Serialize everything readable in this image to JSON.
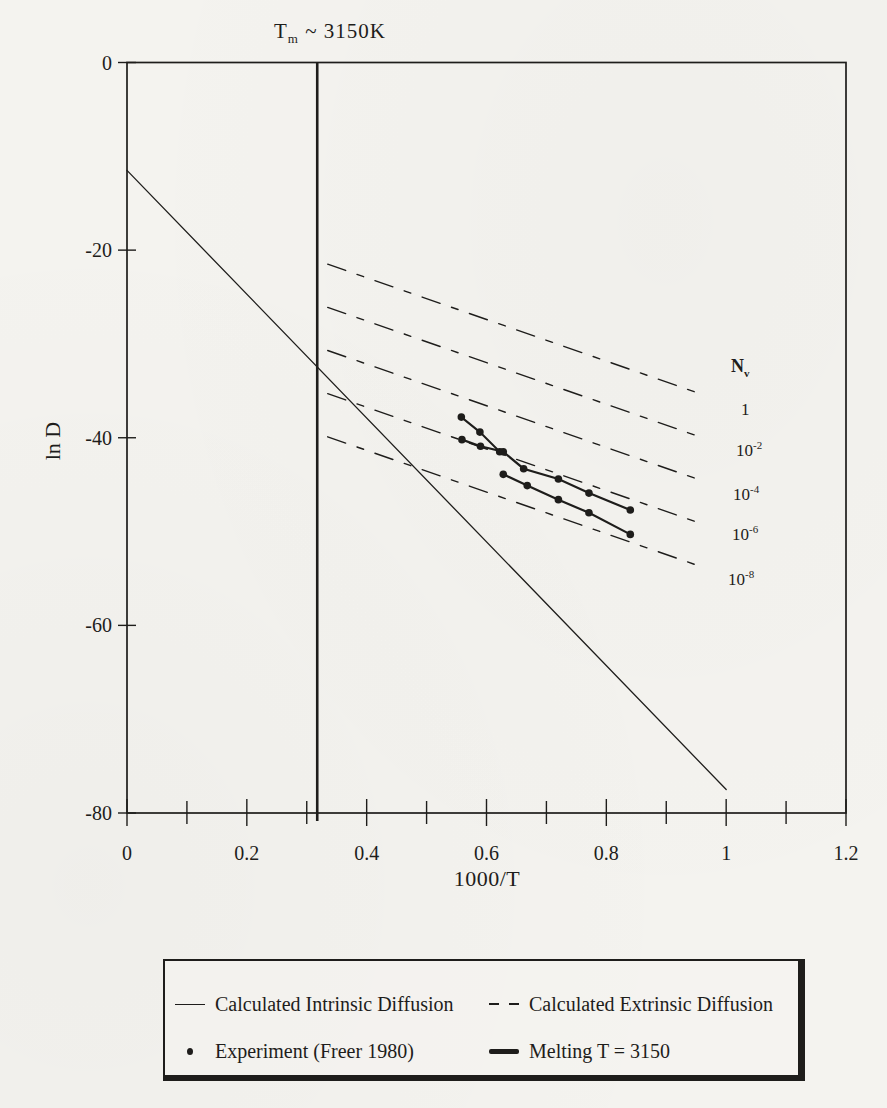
{
  "page": {
    "background": "#f4f3ef",
    "ink": "#1e1d1b"
  },
  "title": {
    "base": "T",
    "sub": "m",
    "rest": "~ 3150K"
  },
  "axes": {
    "x": {
      "label": "1000/T"
    },
    "y": {
      "label": "ln D"
    }
  },
  "nv": {
    "header": {
      "base": "N",
      "sub": "v"
    },
    "labels": [
      {
        "base": "1",
        "exp": ""
      },
      {
        "base": "10",
        "exp": "-2"
      },
      {
        "base": "10",
        "exp": "-4"
      },
      {
        "base": "10",
        "exp": "-6"
      },
      {
        "base": "10",
        "exp": "-8"
      }
    ]
  },
  "legend": {
    "entries": [
      {
        "swatch": "thin-solid-line",
        "label": "Calculated Intrinsic Diffusion"
      },
      {
        "swatch": "dashed-line",
        "label": "Calculated Extrinsic Diffusion"
      },
      {
        "swatch": "dot-marker",
        "label": "Experiment (Freer 1980)"
      },
      {
        "swatch": "thick-solid-line",
        "label": "Melting T = 3150"
      }
    ]
  },
  "chart_data": {
    "type": "line",
    "xlabel": "1000/T",
    "ylabel": "ln D",
    "xlim": [
      0,
      1.2
    ],
    "ylim": [
      -80,
      0
    ],
    "grid": false,
    "legend_position": "bottom",
    "x_minor_step": 0.1,
    "x_ticks": [
      {
        "v": 0,
        "t": "0"
      },
      {
        "v": 0.2,
        "t": "0.2"
      },
      {
        "v": 0.4,
        "t": "0.4"
      },
      {
        "v": 0.6,
        "t": "0.6"
      },
      {
        "v": 0.8,
        "t": "0.8"
      },
      {
        "v": 1,
        "t": "1"
      },
      {
        "v": 1.2,
        "t": "1.2"
      }
    ],
    "y_ticks": [
      {
        "v": 0,
        "t": "0"
      },
      {
        "v": -20,
        "t": "-20"
      },
      {
        "v": -40,
        "t": "-40"
      },
      {
        "v": -60,
        "t": "-60"
      },
      {
        "v": -80,
        "t": "-80"
      }
    ],
    "series": [
      {
        "id": "intrinsic-diffusion-line",
        "name": "Calculated Intrinsic Diffusion",
        "style": "solid",
        "width": 1.3,
        "points": [
          [
            0,
            -11.5
          ],
          [
            1.0,
            -77.5
          ]
        ]
      },
      {
        "id": "melting-temperature-line",
        "name": "Melting T = 3150",
        "type": "vline",
        "style": "solid",
        "width": 2.6,
        "x": 0.3175
      },
      {
        "id": "extrinsic-nv-1-line",
        "name": "Calculated Extrinsic Diffusion Nv=1",
        "style": "dashed",
        "width": 1.4,
        "nv": "1",
        "points": [
          [
            0.335,
            -21.5
          ],
          [
            0.965,
            -35.5
          ]
        ]
      },
      {
        "id": "extrinsic-nv-1e-2-line",
        "name": "Calculated Extrinsic Diffusion Nv=10^-2",
        "style": "dashed",
        "width": 1.4,
        "nv": "10^-2",
        "points": [
          [
            0.335,
            -26.1
          ],
          [
            0.965,
            -40.1
          ]
        ]
      },
      {
        "id": "extrinsic-nv-1e-4-line",
        "name": "Calculated Extrinsic Diffusion Nv=10^-4",
        "style": "dashed",
        "width": 1.4,
        "nv": "10^-4",
        "points": [
          [
            0.335,
            -30.7
          ],
          [
            0.965,
            -44.7
          ]
        ]
      },
      {
        "id": "extrinsic-nv-1e-6-line",
        "name": "Calculated Extrinsic Diffusion Nv=10^-6",
        "style": "dashed",
        "width": 1.4,
        "nv": "10^-6",
        "points": [
          [
            0.335,
            -35.3
          ],
          [
            0.965,
            -49.3
          ]
        ]
      },
      {
        "id": "extrinsic-nv-1e-8-line",
        "name": "Calculated Extrinsic Diffusion Nv=10^-8",
        "style": "dashed",
        "width": 1.4,
        "nv": "10^-8",
        "points": [
          [
            0.335,
            -39.9
          ],
          [
            0.965,
            -53.9
          ]
        ]
      },
      {
        "id": "experiment-branch-line",
        "name": "Experiment (Freer 1980) upper branch",
        "style": "solid",
        "width": 2.0,
        "marker": "dot",
        "points": [
          [
            0.558,
            -37.8
          ],
          [
            0.589,
            -39.4
          ],
          [
            0.622,
            -41.5
          ]
        ]
      },
      {
        "id": "experiment-upper-line",
        "name": "Experiment (Freer 1980) series A",
        "style": "solid",
        "width": 2.2,
        "marker": "dot",
        "points": [
          [
            0.559,
            -40.2
          ],
          [
            0.59,
            -40.9
          ],
          [
            0.628,
            -41.5
          ],
          [
            0.662,
            -43.3
          ],
          [
            0.72,
            -44.4
          ],
          [
            0.771,
            -45.9
          ],
          [
            0.84,
            -47.7
          ]
        ]
      },
      {
        "id": "experiment-lower-line",
        "name": "Experiment (Freer 1980) series B",
        "style": "solid",
        "width": 2.2,
        "marker": "dot",
        "points": [
          [
            0.628,
            -43.9
          ],
          [
            0.668,
            -45.1
          ],
          [
            0.72,
            -46.6
          ],
          [
            0.771,
            -48.0
          ],
          [
            0.84,
            -50.3
          ]
        ]
      }
    ]
  }
}
